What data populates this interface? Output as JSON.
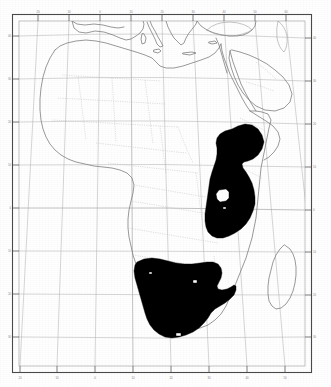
{
  "figure": {
    "kind": "distribution-map",
    "region": "Africa",
    "projection_style": "conic-graticule",
    "background_color": "#ffffff",
    "frame_color": "#4a4a4a",
    "shading_color": "#000000",
    "coastline_color": "#7d7d7d",
    "border_color": "#bdbdbd",
    "graticule_color": "#b4b4b4"
  },
  "frame": {
    "outer": {
      "x": 12,
      "y": 14,
      "width": 300,
      "height": 359
    },
    "inner": {
      "x": 19,
      "y": 21,
      "width": 286,
      "height": 345
    }
  },
  "graticule": {
    "spacing_degrees": 10,
    "lon_ticks": [
      "-20",
      "-10",
      "0",
      "10",
      "20",
      "30",
      "40",
      "50",
      "60"
    ],
    "lat_ticks": [
      "40",
      "30",
      "20",
      "10",
      "0",
      "-10",
      "-20",
      "-30"
    ],
    "top_tick_labels": [
      "20",
      "10",
      "0",
      "10",
      "20",
      "30",
      "40",
      "50",
      "60"
    ],
    "bottom_tick_labels": [
      "20",
      "10",
      "0",
      "10",
      "20",
      "30",
      "40",
      "50",
      "60"
    ],
    "left_tick_labels": [
      "40",
      "30",
      "20",
      "10",
      "0",
      "10",
      "20",
      "30"
    ],
    "right_tick_labels": [
      "40",
      "30",
      "20",
      "10",
      "0",
      "10",
      "20",
      "30"
    ]
  },
  "distribution": {
    "label": "shaded range",
    "areas": [
      {
        "name": "east-african-range",
        "description": "Horn of Africa south through East Africa"
      },
      {
        "name": "southern-african-range",
        "description": "Namibia, Botswana, South Africa"
      }
    ],
    "holes": [
      {
        "name": "lake-victoria-hole",
        "description": "unshaded lake within east african range"
      }
    ]
  },
  "landmasses": [
    {
      "name": "africa-mainland"
    },
    {
      "name": "madagascar"
    },
    {
      "name": "arabian-peninsula"
    },
    {
      "name": "southern-europe"
    },
    {
      "name": "anatolia"
    },
    {
      "name": "iberia"
    },
    {
      "name": "italy"
    },
    {
      "name": "sicily"
    },
    {
      "name": "crete"
    },
    {
      "name": "cyprus"
    },
    {
      "name": "black-sea"
    },
    {
      "name": "caspian-sea"
    }
  ]
}
